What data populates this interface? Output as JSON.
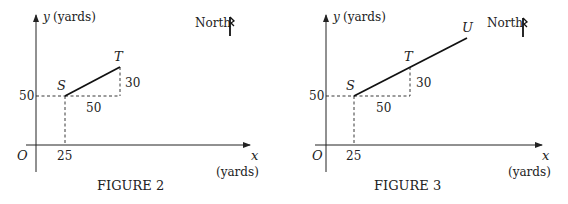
{
  "figures": [
    {
      "caption": "FIGURE 2",
      "y_axis_label": "y (yards)",
      "y_axis_var": "y",
      "y_axis_unit": "(yards)",
      "x_axis_var": "x",
      "x_axis_unit": "(yards)",
      "origin_label": "O",
      "x_tick": "25",
      "y_tick": "50",
      "north_label": "North",
      "points": {
        "S": "S",
        "T": "T"
      },
      "run_label": "50",
      "rise_label": "30"
    },
    {
      "caption": "FIGURE 3",
      "y_axis_label": "y (yards)",
      "y_axis_var": "y",
      "y_axis_unit": "(yards)",
      "x_axis_var": "x",
      "x_axis_unit": "(yards)",
      "origin_label": "O",
      "x_tick": "25",
      "y_tick": "50",
      "north_label": "North",
      "points": {
        "S": "S",
        "T": "T",
        "U": "U"
      },
      "run_label": "50",
      "rise_label": "30"
    }
  ],
  "colors": {
    "ink": "#222222",
    "background": "#ffffff"
  }
}
